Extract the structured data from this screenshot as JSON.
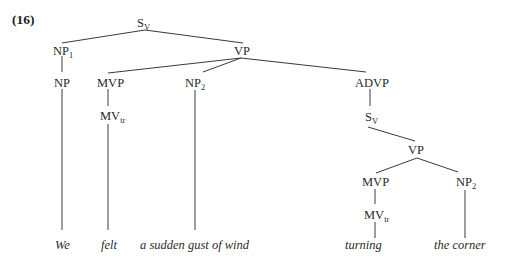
{
  "example_number": "(16)",
  "tree": {
    "root": {
      "label": "S",
      "sub": "V"
    },
    "np1": {
      "label": "NP",
      "sub": "1"
    },
    "np": {
      "label": "NP",
      "sub": ""
    },
    "vp": {
      "label": "VP",
      "sub": ""
    },
    "mvp1": {
      "label": "MVP",
      "sub": ""
    },
    "mvtr1": {
      "label": "MV",
      "sub": "tr"
    },
    "np2a": {
      "label": "NP",
      "sub": "2"
    },
    "advp": {
      "label": "ADVP",
      "sub": ""
    },
    "sv2": {
      "label": "S",
      "sub": "V"
    },
    "vp2": {
      "label": "VP",
      "sub": ""
    },
    "mvp2": {
      "label": "MVP",
      "sub": ""
    },
    "mvtr2": {
      "label": "MV",
      "sub": "tr"
    },
    "np2b": {
      "label": "NP",
      "sub": "2"
    }
  },
  "words": [
    "We",
    "felt",
    "a sudden gust of wind",
    "turning",
    "the corner"
  ]
}
